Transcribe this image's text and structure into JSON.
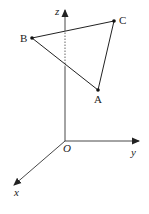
{
  "diagram": {
    "type": "3d-coordinate-system-with-triangle",
    "axes": {
      "x": {
        "label": "x"
      },
      "y": {
        "label": "y"
      },
      "z": {
        "label": "z"
      },
      "origin": {
        "label": "O"
      }
    },
    "points": [
      {
        "name": "A",
        "label": "A"
      },
      {
        "name": "B",
        "label": "B"
      },
      {
        "name": "C",
        "label": "C"
      }
    ],
    "edges": [
      [
        "A",
        "B"
      ],
      [
        "B",
        "C"
      ],
      [
        "C",
        "A"
      ]
    ],
    "colors": {
      "stroke": "#222222",
      "background": "#ffffff"
    }
  }
}
